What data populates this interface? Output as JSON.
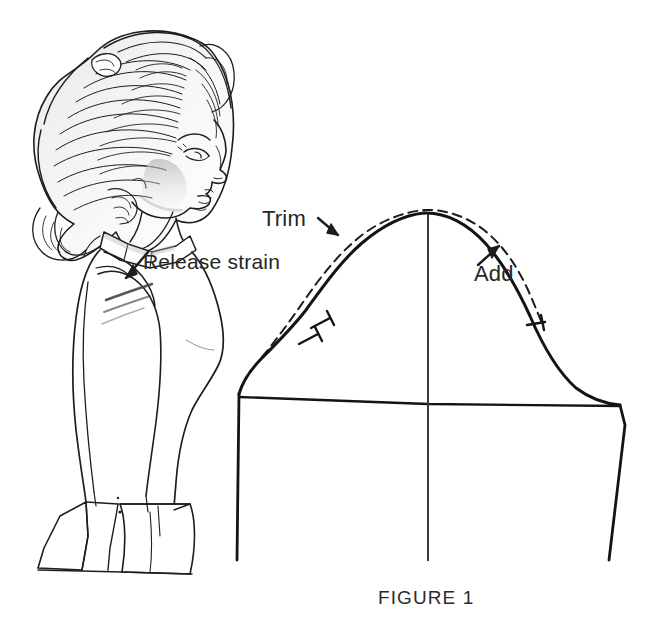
{
  "figure": {
    "caption": "FIGURE 1",
    "background_color": "#ffffff",
    "ink_color": "#1a1a1a"
  },
  "illustration": {
    "name": "woman-profile-sketch",
    "description": "Fashion illustration of a woman in profile facing right, with voluminous bouffant hair, wearing a fitted jacket with a shoulder strain wrinkle and a flared hem"
  },
  "annotations": [
    {
      "id": "release-strain",
      "text": "Release strain",
      "arrow": "down-left",
      "target": "shoulder-seam"
    },
    {
      "id": "trim",
      "text": "Trim",
      "arrow": "down-right",
      "target": "back-sleeve-cap"
    },
    {
      "id": "add",
      "text": "Add",
      "arrow": "up-right",
      "target": "front-sleeve-cap"
    }
  ],
  "pattern": {
    "name": "sleeve-cap-pattern",
    "original_line_style": "solid",
    "adjusted_line_style": "dashed",
    "notches": {
      "back_count": 2,
      "front_count": 1
    },
    "guides": {
      "center_grainline": "vertical",
      "bicep_line": "horizontal"
    }
  }
}
